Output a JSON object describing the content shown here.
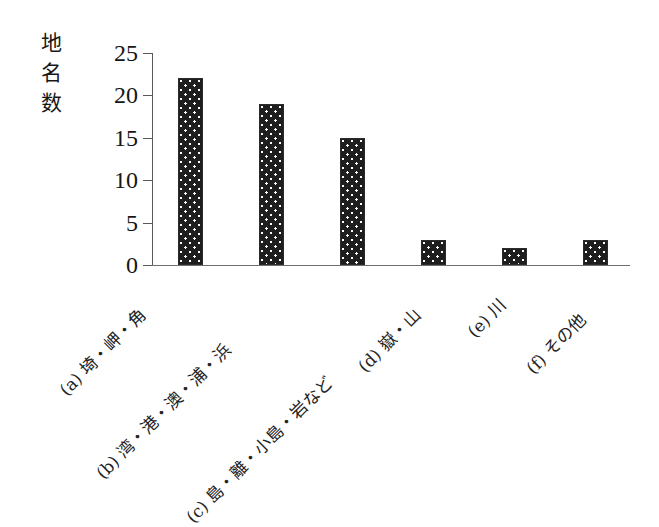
{
  "chart_data": {
    "type": "bar",
    "title": "",
    "subtitle": "",
    "xlabel": "",
    "ylabel": "地名数",
    "ylabel_chars": "地\n名\n数",
    "ylim": [
      0,
      25
    ],
    "yticks": [
      0,
      5,
      10,
      15,
      20,
      25
    ],
    "ytick_labels": [
      "0",
      "5",
      "10",
      "15",
      "20",
      "25"
    ],
    "grid": false,
    "legend": false,
    "legend_position": "none",
    "categories": [
      "(a) 埼・岬・角",
      "(b) 湾・港・澳・浦・浜",
      "(c) 島・離・小島・岩など",
      "(d) 嶽・山",
      "(e) 川",
      "(f) その他"
    ],
    "values": [
      22,
      19,
      15,
      3,
      2,
      3
    ],
    "bar_color": "#1e1e1e",
    "bar_pattern": "dotted-fill",
    "axis_color": "#5a5a5a",
    "background_color": "#ffffff"
  }
}
